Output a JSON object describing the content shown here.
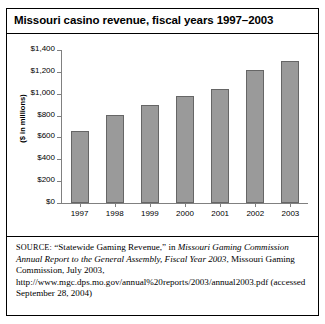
{
  "figure": {
    "title": "Missouri casino revenue, fiscal years 1997–2003",
    "source_prefix": "SOURCE:",
    "source_part1": " “Statewide Gaming Revenue,” in ",
    "source_italic1": "Missouri Gaming Commission Annual Report to the General Assembly, Fiscal Year 2003",
    "source_part2": ", Missouri Gaming Commission, July 2003, http://www.mgc.dps.mo.gov/annual%20reports/2003/annual2003.pdf (accessed September 28, 2004)"
  },
  "chart_data": {
    "type": "bar",
    "title": "Missouri casino revenue, fiscal years 1997–2003",
    "xlabel": "",
    "ylabel": "($ in millions)",
    "categories": [
      "1997",
      "1998",
      "1999",
      "2000",
      "2001",
      "2002",
      "2003"
    ],
    "values": [
      655,
      805,
      895,
      975,
      1045,
      1215,
      1300
    ],
    "ylim": [
      0,
      1400
    ],
    "ytick_values": [
      0,
      200,
      400,
      600,
      800,
      1000,
      1200,
      1400
    ],
    "ytick_labels": [
      "$0",
      "$200",
      "$400",
      "$600",
      "$800",
      "$1,000",
      "$1,200",
      "$1,400"
    ],
    "grid": false,
    "legend": "none",
    "bar_color": "#9a9a9a",
    "bar_border_color": "#666666",
    "axis_color": "#808080"
  }
}
